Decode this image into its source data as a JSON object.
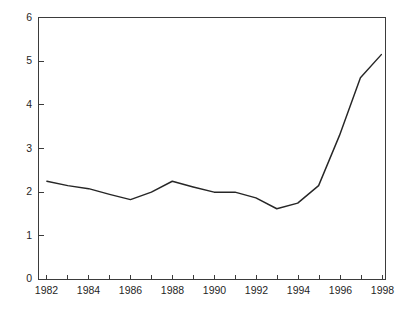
{
  "chart_data": {
    "type": "line",
    "title": "",
    "subtitle": "",
    "xlabel": "",
    "ylabel": "",
    "x": [
      1982,
      1983,
      1984,
      1985,
      1986,
      1987,
      1988,
      1989,
      1990,
      1991,
      1992,
      1993,
      1994,
      1995,
      1996,
      1997,
      1998
    ],
    "values": [
      2.25,
      2.15,
      2.08,
      1.95,
      1.83,
      2.0,
      2.25,
      2.12,
      2.0,
      2.0,
      1.87,
      1.62,
      1.75,
      2.15,
      3.3,
      4.62,
      5.15
    ],
    "series": [
      {
        "name": "series-1",
        "values": [
          2.25,
          2.15,
          2.08,
          1.95,
          1.83,
          2.0,
          2.25,
          2.12,
          2.0,
          2.0,
          1.87,
          1.62,
          1.75,
          2.15,
          3.3,
          4.62,
          5.15
        ],
        "color": "#262626"
      }
    ],
    "xlim": [
      1981.6,
      1998.2
    ],
    "ylim": [
      0,
      6
    ],
    "x_ticks": [
      1982,
      1983,
      1984,
      1985,
      1986,
      1987,
      1988,
      1989,
      1990,
      1991,
      1992,
      1993,
      1994,
      1995,
      1996,
      1997,
      1998
    ],
    "x_tick_labels": [
      "1982",
      "",
      "1984",
      "",
      "1986",
      "",
      "1988",
      "",
      "1990",
      "",
      "1992",
      "",
      "1994",
      "",
      "1996",
      "",
      "1998"
    ],
    "y_ticks": [
      0,
      1,
      2,
      3,
      4,
      5,
      6
    ],
    "y_tick_labels": [
      "0",
      "1",
      "2",
      "3",
      "4",
      "5",
      "6"
    ],
    "grid": false,
    "legend": false,
    "legend_position": "none",
    "annotations": []
  },
  "colors": {
    "line": "#262626",
    "axis": "#3b3b3b",
    "text": "#1f1f1f",
    "background": "#ffffff"
  },
  "axis_labels": {
    "y0": "0",
    "y1": "1",
    "y2": "2",
    "y3": "3",
    "y4": "4",
    "y5": "5",
    "y6": "6",
    "x1982": "1982",
    "x1984": "1984",
    "x1986": "1986",
    "x1988": "1988",
    "x1990": "1990",
    "x1992": "1992",
    "x1994": "1994",
    "x1996": "1996",
    "x1998": "1998"
  }
}
